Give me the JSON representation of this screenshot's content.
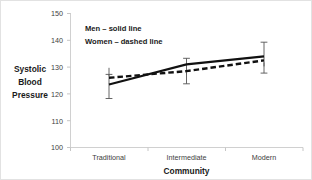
{
  "chart_data": {
    "type": "line",
    "title": "",
    "xlabel": "Community",
    "ylabel": "Systolic Blood Pressure",
    "categories": [
      "Traditional",
      "Intermediate",
      "Modern"
    ],
    "ylim": [
      100,
      150
    ],
    "yticks": [
      100,
      110,
      120,
      130,
      140,
      150
    ],
    "ytick_labels": [
      "100",
      "110",
      "120",
      "130",
      "140",
      "150"
    ],
    "grid": false,
    "legend_position": "inside-top-left",
    "series": [
      {
        "name": "Men",
        "style": "solid line",
        "values": [
          123.5,
          131.0,
          134.0
        ],
        "errors": [
          4.5,
          3.0,
          3.0
        ]
      },
      {
        "name": "Women",
        "style": "dashed line",
        "values": [
          126.0,
          128.5,
          132.5
        ],
        "errors": [
          1.5,
          2.0,
          2.0
        ]
      }
    ],
    "annotations": [
      "Men – solid line",
      "Women – dashed line"
    ],
    "colors": {
      "series_line": "#111111",
      "error_bar": "#555555",
      "axis": "#d0d0d0",
      "tick_text": "#3d3d3d",
      "title_text": "#1a1a1a",
      "background": "#ffffff",
      "border": "#e2e2e2"
    }
  },
  "axis": {
    "y_label_line1": "Systolic",
    "y_label_line2": "Blood",
    "y_label_line3": "Pressure",
    "x_title": "Community"
  },
  "legend": {
    "men": "Men – solid line",
    "women": "Women – dashed line"
  },
  "yticks": {
    "t150": "150",
    "t140": "140",
    "t130": "130",
    "t120": "120",
    "t110": "110",
    "t100": "100"
  },
  "xticks": {
    "c0": "Traditional",
    "c1": "Intermediate",
    "c2": "Modern"
  }
}
